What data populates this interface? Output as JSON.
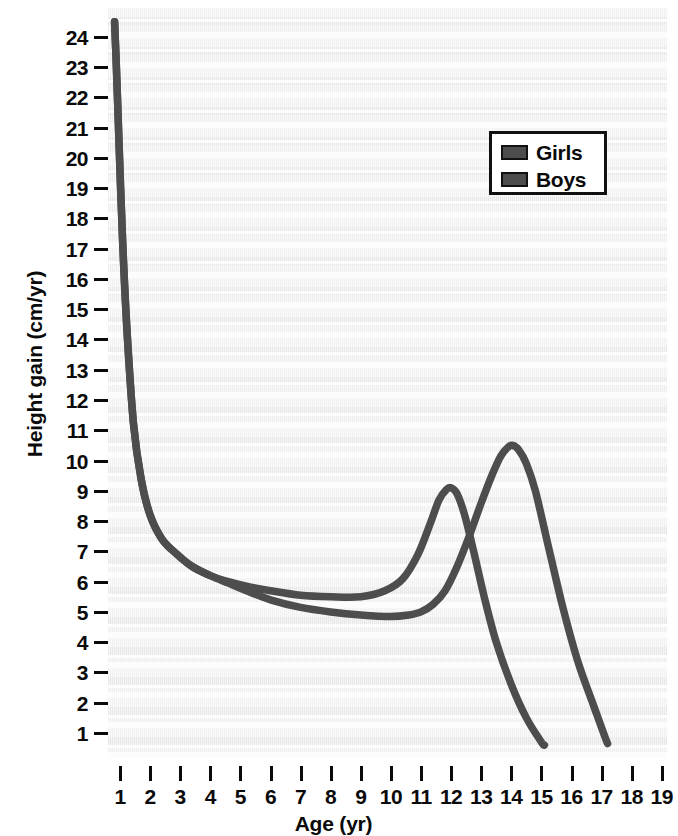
{
  "chart_data": {
    "type": "line",
    "title": "",
    "xlabel": "Age (yr)",
    "ylabel": "Height gain (cm/yr)",
    "xlim": [
      0.55,
      19.6
    ],
    "ylim": [
      0.0,
      24.6
    ],
    "grid": true,
    "legend_position": "upper-right",
    "x_ticks": [
      1,
      2,
      3,
      4,
      5,
      6,
      7,
      8,
      9,
      10,
      11,
      12,
      13,
      14,
      15,
      16,
      17,
      18,
      19
    ],
    "y_ticks": [
      1,
      2,
      3,
      4,
      5,
      6,
      7,
      8,
      9,
      10,
      11,
      12,
      13,
      14,
      15,
      16,
      17,
      18,
      19,
      20,
      21,
      22,
      23,
      24
    ],
    "series": [
      {
        "name": "Girls",
        "color": "#4d4d4d",
        "peak_age": 12.0,
        "peak_value": 9.1,
        "x": [
          0.82,
          0.88,
          0.95,
          1.02,
          1.12,
          1.25,
          1.45,
          1.7,
          2.0,
          2.4,
          2.9,
          3.4,
          4.0,
          4.6,
          5.2,
          6.0,
          7.0,
          8.0,
          9.0,
          9.8,
          10.4,
          10.9,
          11.3,
          11.6,
          11.85,
          12.0,
          12.2,
          12.45,
          12.75,
          13.1,
          13.5,
          14.0,
          14.5,
          15.0,
          15.1
        ],
        "y": [
          24.5,
          23.0,
          21.0,
          19.0,
          16.5,
          14.0,
          11.2,
          9.4,
          8.2,
          7.4,
          6.9,
          6.5,
          6.2,
          6.0,
          5.85,
          5.7,
          5.55,
          5.5,
          5.5,
          5.7,
          6.1,
          6.9,
          7.9,
          8.7,
          9.05,
          9.1,
          8.9,
          8.2,
          7.0,
          5.5,
          4.0,
          2.6,
          1.5,
          0.7,
          0.6
        ]
      },
      {
        "name": "Boys",
        "color": "#4d4d4d",
        "peak_age": 14.05,
        "peak_value": 10.5,
        "x": [
          0.82,
          0.88,
          0.95,
          1.02,
          1.12,
          1.25,
          1.45,
          1.7,
          2.0,
          2.4,
          2.9,
          3.4,
          4.0,
          4.6,
          5.2,
          6.0,
          7.0,
          8.0,
          9.0,
          10.0,
          10.6,
          11.0,
          11.4,
          11.8,
          12.2,
          12.6,
          13.0,
          13.35,
          13.65,
          13.9,
          14.05,
          14.25,
          14.5,
          14.8,
          15.2,
          15.7,
          16.2,
          16.7,
          17.1,
          17.2
        ],
        "y": [
          24.5,
          23.0,
          21.0,
          19.0,
          16.5,
          14.0,
          11.2,
          9.4,
          8.2,
          7.4,
          6.9,
          6.5,
          6.2,
          5.95,
          5.7,
          5.4,
          5.15,
          5.0,
          4.9,
          4.85,
          4.9,
          5.0,
          5.25,
          5.7,
          6.5,
          7.5,
          8.6,
          9.5,
          10.15,
          10.45,
          10.5,
          10.35,
          9.9,
          9.0,
          7.3,
          5.2,
          3.4,
          2.0,
          0.9,
          0.65
        ]
      }
    ]
  },
  "axes": {
    "y_title": "Height gain (cm/yr)",
    "x_title": "Age (yr)",
    "y_tick_labels": [
      "24",
      "23",
      "22",
      "21",
      "20",
      "19",
      "18",
      "17",
      "16",
      "15",
      "14",
      "13",
      "12",
      "11",
      "10",
      "9",
      "8",
      "7",
      "6",
      "5",
      "4",
      "3",
      "2",
      "1"
    ],
    "x_tick_labels": [
      "1",
      "2",
      "3",
      "4",
      "5",
      "6",
      "7",
      "8",
      "9",
      "10",
      "11",
      "12",
      "13",
      "14",
      "15",
      "16",
      "17",
      "18",
      "19"
    ]
  },
  "legend": {
    "entries": [
      {
        "label": "Girls",
        "color": "#4d4d4d"
      },
      {
        "label": "Boys",
        "color": "#4d4d4d"
      }
    ]
  },
  "colors": {
    "curve": "#4d4d4d",
    "text": "#0a0a0a",
    "plot_background": "#eeeeee",
    "page_background": "#ffffff"
  }
}
